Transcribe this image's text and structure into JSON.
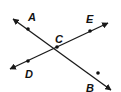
{
  "diagram": {
    "title": "",
    "colors": {
      "stroke": "#1a1a1a",
      "point": "#111111",
      "label": "#111111"
    },
    "lines": [
      {
        "name": "line-AB",
        "from": [
          13,
          19
        ],
        "to": [
          111,
          90
        ]
      },
      {
        "name": "line-DE",
        "from": [
          10,
          69
        ],
        "to": [
          108,
          23
        ]
      }
    ],
    "points": [
      {
        "label": "A",
        "x": 28,
        "y": 29,
        "lx": 28,
        "ly": 21
      },
      {
        "label": "E",
        "x": 90,
        "y": 31,
        "lx": 86,
        "ly": 23
      },
      {
        "label": "C",
        "x": 57,
        "y": 47,
        "lx": 55,
        "ly": 43
      },
      {
        "label": "D",
        "x": 28,
        "y": 61,
        "lx": 25,
        "ly": 78
      },
      {
        "label": "B",
        "x": 98,
        "y": 73,
        "lx": 86,
        "ly": 92
      }
    ]
  }
}
